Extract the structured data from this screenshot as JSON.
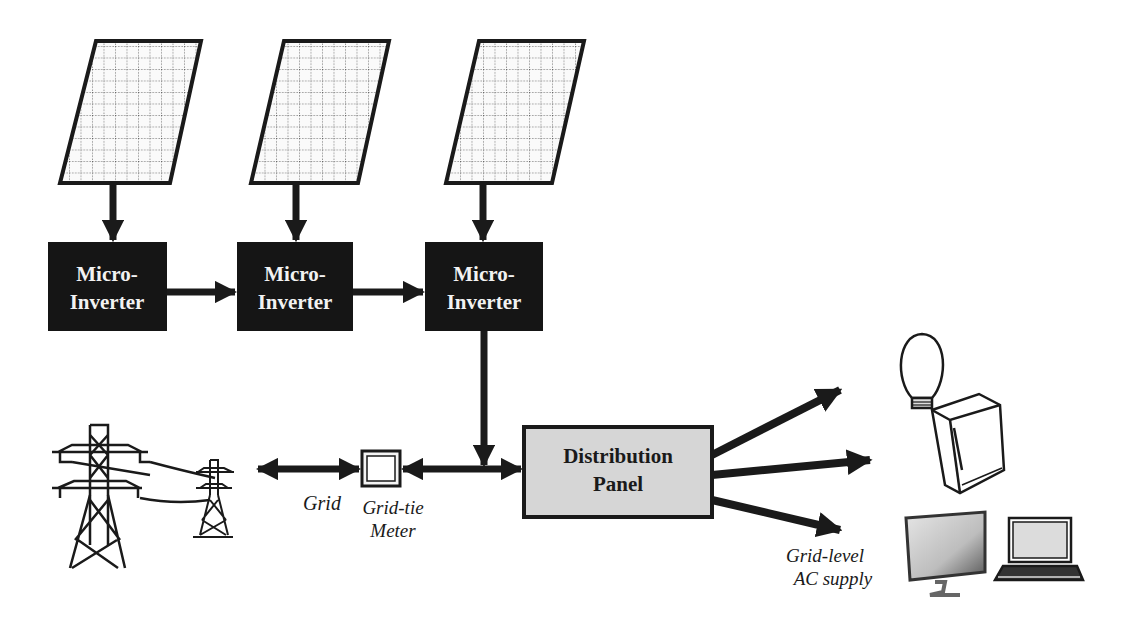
{
  "diagram": {
    "colors": {
      "background": "#ffffff",
      "ink": "#1a1a1a",
      "inverter_fill": "#151515",
      "inverter_text": "#f2f2f2",
      "panel_fill": "#d6d6d6",
      "meter_fill": "#f4f4f4"
    },
    "solar_panels": [
      {
        "id": "solar-panel-1",
        "icon": "solar-panel-icon"
      },
      {
        "id": "solar-panel-2",
        "icon": "solar-panel-icon"
      },
      {
        "id": "solar-panel-3",
        "icon": "solar-panel-icon"
      }
    ],
    "inverters": [
      {
        "line1": "Micro-",
        "line2": "Inverter"
      },
      {
        "line1": "Micro-",
        "line2": "Inverter"
      },
      {
        "line1": "Micro-",
        "line2": "Inverter"
      }
    ],
    "distribution_panel": {
      "line1": "Distribution",
      "line2": "Panel"
    },
    "labels": {
      "grid": "Grid",
      "meter_line1": "Grid-tie",
      "meter_line2": "Meter",
      "supply_line1": "Grid-level",
      "supply_line2": "AC supply"
    },
    "loads": [
      {
        "name": "light-bulb",
        "icon": "light-bulb-icon"
      },
      {
        "name": "refrigerator",
        "icon": "refrigerator-icon"
      },
      {
        "name": "monitor",
        "icon": "monitor-icon"
      },
      {
        "name": "laptop",
        "icon": "laptop-icon"
      }
    ],
    "grid_icons": [
      {
        "name": "large-transmission-tower",
        "icon": "transmission-tower-icon"
      },
      {
        "name": "small-transmission-tower",
        "icon": "transmission-tower-icon"
      }
    ]
  }
}
